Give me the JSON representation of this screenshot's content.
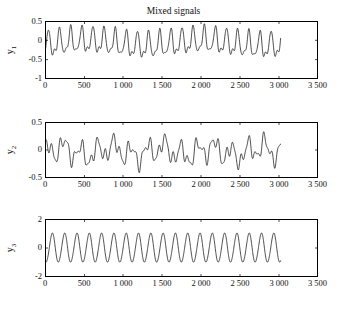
{
  "figure": {
    "title": "Mixed signals",
    "background": "#ffffff",
    "line_color": "#000000"
  },
  "axes": {
    "x_ticks": [
      "0",
      "500",
      "1 000",
      "1 500",
      "2 000",
      "2 500",
      "3 000",
      "3 500"
    ],
    "x_tick_values": [
      0,
      500,
      1000,
      1500,
      2000,
      2500,
      3000,
      3500
    ],
    "xlim": [
      0,
      3500
    ],
    "subplot1": {
      "ylabel": "y",
      "ylabel_sub": "1",
      "y_ticks": [
        "0.5",
        "0",
        "-0.5",
        "-1"
      ],
      "y_tick_values": [
        0.5,
        0,
        -0.5,
        -1
      ],
      "ylim": [
        -1,
        0.5
      ]
    },
    "subplot2": {
      "ylabel": "y",
      "ylabel_sub": "2",
      "y_ticks": [
        "0.5",
        "0",
        "-0.5"
      ],
      "y_tick_values": [
        0.5,
        0,
        -0.5
      ],
      "ylim": [
        -0.5,
        0.5
      ]
    },
    "subplot3": {
      "ylabel": "y",
      "ylabel_sub": "3",
      "y_ticks": [
        "2",
        "0",
        "-2"
      ],
      "y_tick_values": [
        2,
        0,
        -2
      ],
      "ylim": [
        -2,
        2
      ]
    }
  },
  "chart_data": {
    "type": "line",
    "title": "Mixed signals",
    "xlabel": "",
    "grid": false,
    "legend": null,
    "xlim": [
      0,
      3500
    ],
    "x_ticks": [
      0,
      500,
      1000,
      1500,
      2000,
      2500,
      3000,
      3500
    ],
    "x_tick_labels": [
      "0",
      "500",
      "1 000",
      "1 500",
      "2 000",
      "2 500",
      "3 000",
      "3 500"
    ],
    "x_range_of_data": [
      0,
      3020
    ],
    "n_samples": 3020,
    "panels": [
      {
        "name": "y1",
        "ylabel": "y1",
        "ylim": [
          -1,
          0.5
        ],
        "y_ticks": [
          0.5,
          0,
          -0.5,
          -1
        ],
        "y_tick_labels": [
          "0.5",
          "0",
          "-0.5",
          "-1"
        ],
        "description": "Mixed signal 1: fast asymmetric oscillation, about 21 cycles over 3000 samples (period ~143), peaks near +0.35, troughs near -0.55, narrow sharp troughs and rounded crests, with a slow modulation riding on top.",
        "series": [
          {
            "name": "y1",
            "model": "0.07*sin(2*pi*x/1500 - 0.6) - 0.08 + 0.30*sin(2*pi*x/143) - 0.12*sin(4*pi*x/143 + 1.2) + 0.035*sin(2*pi*x/52)",
            "approx_peak": 0.35,
            "approx_trough": -0.57,
            "period": 143,
            "cycles": 21
          }
        ]
      },
      {
        "name": "y2",
        "ylabel": "y2",
        "ylim": [
          -0.5,
          0.5
        ],
        "y_ticks": [
          0.5,
          0,
          -0.5
        ],
        "y_tick_labels": [
          "0.5",
          "0",
          "-0.5"
        ],
        "description": "Mixed signal 2: irregular multi-component waveform oscillating roughly between -0.40 and +0.33, with grouped bursts of 2-3 ripples and deeper isolated dips near x=950, x=1600 and x=2300.",
        "series": [
          {
            "name": "y2",
            "model": "0.16*sin(2*pi*x/215 + 0.9) + 0.11*sin(2*pi*x/97 + 2.1) + 0.07*sin(2*pi*x/640 - 0.4) + 0.05*sin(2*pi*x/58) - 0.03",
            "approx_peak": 0.33,
            "approx_trough": -0.4
          }
        ]
      },
      {
        "name": "y3",
        "ylabel": "y3",
        "ylim": [
          -2,
          2
        ],
        "y_ticks": [
          2,
          0,
          -2
        ],
        "y_tick_labels": [
          "2",
          "0",
          "-2"
        ],
        "description": "Mixed signal 3: near-pure sinusoid of amplitude about 1.0, roughly 19 cycles over 3000 samples (period ~158), slightly rounded crests and troughs.",
        "series": [
          {
            "name": "y3",
            "model": "1.02*sin(2*pi*x/158 - 1.9) + 0.05*sin(4*pi*x/158)",
            "amplitude": 1.02,
            "period": 158,
            "cycles": 19
          }
        ]
      }
    ]
  }
}
